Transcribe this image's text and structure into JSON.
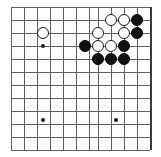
{
  "figure": {
    "kind": "go-board-diagram",
    "board_color": "#ffffff",
    "line_color": "#5f5f5f",
    "edge_color": "#3a3a3a",
    "black_color": "#121212",
    "white_color": "#ffffff"
  },
  "board": {
    "origin_x": 11,
    "origin_y": 7,
    "spacing": 13,
    "cols": 11,
    "rows": 12,
    "right_edge_col": 10,
    "h_lines_y": [
      7,
      20,
      33,
      46,
      59,
      72,
      85,
      98,
      111,
      124,
      137,
      150
    ],
    "v_lines_x": [
      11,
      24,
      37,
      50,
      63,
      76,
      89,
      98,
      111,
      124,
      137,
      150
    ],
    "edges": {
      "right_x": 150,
      "top_y": 7,
      "bottom_y": 150,
      "left_x": 11
    }
  },
  "star_points": [
    {
      "name": "hoshi-upper-left",
      "x": 43,
      "y": 46
    },
    {
      "name": "hoshi-lower-left",
      "x": 43,
      "y": 120
    },
    {
      "name": "hoshi-lower-right",
      "x": 116,
      "y": 120
    }
  ],
  "stones": [
    {
      "name": "white-stone-lone",
      "color": "white",
      "x": 43,
      "y": 33
    },
    {
      "name": "white-stone-r1-c1",
      "color": "white",
      "x": 111,
      "y": 20
    },
    {
      "name": "white-stone-r1-c2",
      "color": "white",
      "x": 124,
      "y": 20
    },
    {
      "name": "black-stone-r1-c3",
      "color": "black",
      "x": 137,
      "y": 20
    },
    {
      "name": "white-stone-r2-c1",
      "color": "white",
      "x": 98,
      "y": 33
    },
    {
      "name": "white-stone-r2-c2",
      "color": "white",
      "x": 124,
      "y": 33
    },
    {
      "name": "black-stone-r2-c3",
      "color": "black",
      "x": 137,
      "y": 33
    },
    {
      "name": "black-stone-r3-c0",
      "color": "black",
      "x": 85,
      "y": 46
    },
    {
      "name": "white-stone-r3-c1",
      "color": "white",
      "x": 98,
      "y": 46
    },
    {
      "name": "white-stone-r3-c2",
      "color": "white",
      "x": 111,
      "y": 46
    },
    {
      "name": "black-stone-r3-c3",
      "color": "black",
      "x": 124,
      "y": 46
    },
    {
      "name": "black-stone-r4-c1",
      "color": "black",
      "x": 98,
      "y": 59
    },
    {
      "name": "black-stone-r4-c2",
      "color": "black",
      "x": 111,
      "y": 59
    },
    {
      "name": "black-stone-r4-c3",
      "color": "black",
      "x": 124,
      "y": 59
    }
  ]
}
